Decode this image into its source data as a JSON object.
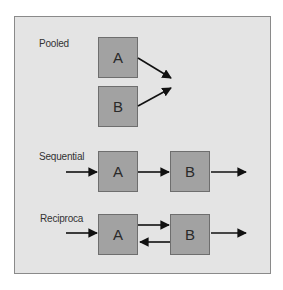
{
  "diagram": {
    "colors": {
      "panel_bg": "#e4e4e4",
      "box_fill": "#a2a2a2",
      "arrow": "#111111"
    },
    "sections": [
      {
        "id": "pooled",
        "label": "Pooled",
        "nodes": [
          "A",
          "B"
        ],
        "edges": [
          {
            "from": "A",
            "to": "out"
          },
          {
            "from": "B",
            "to": "out"
          }
        ]
      },
      {
        "id": "sequential",
        "label": "Sequential",
        "nodes": [
          "A",
          "B"
        ],
        "edges": [
          {
            "from": "in",
            "to": "A"
          },
          {
            "from": "A",
            "to": "B"
          },
          {
            "from": "B",
            "to": "out"
          }
        ]
      },
      {
        "id": "reciprocal",
        "label": "Reciproca",
        "nodes": [
          "A",
          "B"
        ],
        "edges": [
          {
            "from": "in",
            "to": "A"
          },
          {
            "from": "A",
            "to": "B"
          },
          {
            "from": "B",
            "to": "A"
          },
          {
            "from": "B",
            "to": "out"
          }
        ]
      }
    ]
  }
}
